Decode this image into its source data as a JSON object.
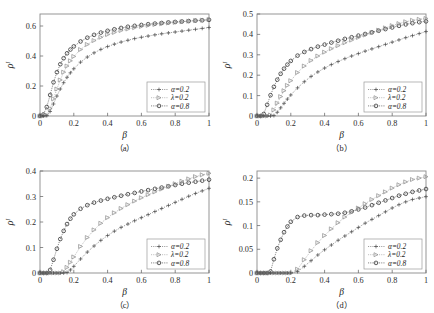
{
  "figure": {
    "panel_count": 4,
    "background": "#ffffff",
    "ink": "#1c1c1c"
  },
  "legend": {
    "entries": [
      {
        "label": "α=0.2",
        "marker": "plus",
        "color": "#4a4a4a"
      },
      {
        "label": "λ=0.2",
        "marker": "triangle-right",
        "color": "#8c8c8c"
      },
      {
        "label": "α=0.8",
        "marker": "circle",
        "color": "#1f1f1f"
      }
    ]
  },
  "axes": {
    "xlabel": "β",
    "ylabel_base": "ρ",
    "ylabel_sup": "I"
  },
  "chart_data": [
    {
      "type": "scatter",
      "panel": "a",
      "caption": "（a）",
      "title": "",
      "xlabel": "β",
      "ylabel": "ρᴵ",
      "xlim": [
        0,
        1
      ],
      "ylim": [
        0,
        0.68
      ],
      "xticks": [
        0,
        0.2,
        0.4,
        0.6,
        0.8,
        1
      ],
      "xticklabels": [
        "0",
        "0.2",
        "0.4",
        "0.6",
        "0.8",
        "1"
      ],
      "yticks": [
        0,
        0.2,
        0.4,
        0.6
      ],
      "yticklabels": [
        "0",
        "0.2",
        "0.4",
        "0.6"
      ],
      "grid": false,
      "legend_position": "lower-right",
      "x": [
        0.0,
        0.02,
        0.04,
        0.06,
        0.08,
        0.1,
        0.12,
        0.14,
        0.16,
        0.18,
        0.2,
        0.24,
        0.28,
        0.32,
        0.36,
        0.4,
        0.44,
        0.48,
        0.52,
        0.56,
        0.6,
        0.64,
        0.68,
        0.72,
        0.76,
        0.8,
        0.84,
        0.88,
        0.92,
        0.96,
        1.0
      ],
      "series": [
        {
          "name": "α=0.8",
          "marker": "circle",
          "color": "#1f1f1f",
          "values": [
            0.0,
            0.01,
            0.06,
            0.14,
            0.225,
            0.292,
            0.345,
            0.385,
            0.418,
            0.443,
            0.464,
            0.497,
            0.522,
            0.541,
            0.556,
            0.568,
            0.578,
            0.587,
            0.595,
            0.601,
            0.607,
            0.612,
            0.616,
            0.62,
            0.624,
            0.627,
            0.63,
            0.633,
            0.636,
            0.638,
            0.641
          ]
        },
        {
          "name": "λ=0.2",
          "marker": "triangle-right",
          "color": "#8c8c8c",
          "values": [
            0.0,
            0.0,
            0.005,
            0.05,
            0.115,
            0.18,
            0.24,
            0.292,
            0.333,
            0.368,
            0.397,
            0.443,
            0.477,
            0.503,
            0.525,
            0.543,
            0.557,
            0.57,
            0.58,
            0.589,
            0.597,
            0.604,
            0.61,
            0.615,
            0.62,
            0.624,
            0.628,
            0.632,
            0.636,
            0.639,
            0.643
          ]
        },
        {
          "name": "α=0.2",
          "marker": "plus",
          "color": "#4a4a4a",
          "values": [
            0.0,
            0.0,
            0.002,
            0.03,
            0.08,
            0.133,
            0.18,
            0.222,
            0.258,
            0.288,
            0.315,
            0.359,
            0.393,
            0.421,
            0.444,
            0.463,
            0.479,
            0.493,
            0.505,
            0.516,
            0.525,
            0.533,
            0.541,
            0.548,
            0.554,
            0.56,
            0.566,
            0.572,
            0.578,
            0.584,
            0.59
          ]
        }
      ]
    },
    {
      "type": "scatter",
      "panel": "b",
      "caption": "（b）",
      "title": "",
      "xlabel": "β",
      "ylabel": "ρᴵ",
      "xlim": [
        0,
        1
      ],
      "ylim": [
        0,
        0.5
      ],
      "xticks": [
        0,
        0.2,
        0.4,
        0.6,
        0.8,
        1
      ],
      "xticklabels": [
        "0",
        "0.2",
        "0.4",
        "0.6",
        "0.8",
        "1"
      ],
      "yticks": [
        0,
        0.1,
        0.2,
        0.3,
        0.4,
        0.5
      ],
      "yticklabels": [
        "0",
        "0.1",
        "0.2",
        "0.3",
        "0.4",
        "0.5"
      ],
      "grid": false,
      "legend_position": "lower-right",
      "x": [
        0.0,
        0.02,
        0.04,
        0.06,
        0.08,
        0.1,
        0.12,
        0.14,
        0.16,
        0.18,
        0.2,
        0.24,
        0.28,
        0.32,
        0.36,
        0.4,
        0.44,
        0.48,
        0.52,
        0.56,
        0.6,
        0.64,
        0.68,
        0.72,
        0.76,
        0.8,
        0.84,
        0.88,
        0.92,
        0.96,
        1.0
      ],
      "series": [
        {
          "name": "α=0.8",
          "marker": "circle",
          "color": "#1f1f1f",
          "values": [
            0.0,
            0.0,
            0.01,
            0.055,
            0.102,
            0.143,
            0.178,
            0.207,
            0.232,
            0.252,
            0.27,
            0.296,
            0.314,
            0.328,
            0.34,
            0.35,
            0.36,
            0.369,
            0.378,
            0.386,
            0.394,
            0.402,
            0.41,
            0.418,
            0.426,
            0.434,
            0.442,
            0.449,
            0.455,
            0.46,
            0.464
          ]
        },
        {
          "name": "λ=0.2",
          "marker": "triangle-right",
          "color": "#8c8c8c",
          "values": [
            0.0,
            0.0,
            0.0,
            0.0,
            0.005,
            0.03,
            0.063,
            0.095,
            0.124,
            0.15,
            0.173,
            0.213,
            0.245,
            0.272,
            0.294,
            0.313,
            0.33,
            0.345,
            0.359,
            0.372,
            0.385,
            0.397,
            0.409,
            0.421,
            0.432,
            0.443,
            0.453,
            0.462,
            0.469,
            0.474,
            0.478
          ]
        },
        {
          "name": "α=0.2",
          "marker": "plus",
          "color": "#4a4a4a",
          "values": [
            0.0,
            0.0,
            0.0,
            0.0,
            0.0,
            0.002,
            0.018,
            0.04,
            0.062,
            0.083,
            0.103,
            0.138,
            0.168,
            0.194,
            0.216,
            0.235,
            0.252,
            0.267,
            0.281,
            0.294,
            0.306,
            0.318,
            0.329,
            0.34,
            0.351,
            0.362,
            0.373,
            0.384,
            0.394,
            0.404,
            0.414
          ]
        }
      ]
    },
    {
      "type": "scatter",
      "panel": "c",
      "caption": "（c）",
      "title": "",
      "xlabel": "β",
      "ylabel": "ρᴵ",
      "xlim": [
        0,
        1
      ],
      "ylim": [
        0,
        0.4
      ],
      "xticks": [
        0,
        0.2,
        0.4,
        0.6,
        0.8,
        1
      ],
      "xticklabels": [
        "0",
        "0.2",
        "0.4",
        "0.6",
        "0.8",
        "1"
      ],
      "yticks": [
        0,
        0.1,
        0.2,
        0.3,
        0.4
      ],
      "yticklabels": [
        "0",
        "0.1",
        "0.2",
        "0.3",
        "0.4"
      ],
      "grid": false,
      "legend_position": "lower-right",
      "x": [
        0.0,
        0.02,
        0.04,
        0.06,
        0.08,
        0.1,
        0.12,
        0.14,
        0.16,
        0.18,
        0.2,
        0.24,
        0.28,
        0.32,
        0.36,
        0.4,
        0.44,
        0.48,
        0.52,
        0.56,
        0.6,
        0.64,
        0.68,
        0.72,
        0.76,
        0.8,
        0.84,
        0.88,
        0.92,
        0.96,
        1.0
      ],
      "series": [
        {
          "name": "α=0.8",
          "marker": "circle",
          "color": "#1f1f1f",
          "values": [
            0.0,
            0.0,
            0.0,
            0.012,
            0.052,
            0.095,
            0.133,
            0.165,
            0.192,
            0.213,
            0.23,
            0.252,
            0.266,
            0.276,
            0.284,
            0.291,
            0.297,
            0.303,
            0.309,
            0.314,
            0.32,
            0.325,
            0.33,
            0.335,
            0.34,
            0.345,
            0.35,
            0.354,
            0.358,
            0.362,
            0.366
          ]
        },
        {
          "name": "λ=0.2",
          "marker": "triangle-right",
          "color": "#8c8c8c",
          "values": [
            0.0,
            0.0,
            0.0,
            0.0,
            0.0,
            0.0,
            0.0,
            0.005,
            0.022,
            0.042,
            0.063,
            0.104,
            0.139,
            0.169,
            0.195,
            0.217,
            0.236,
            0.253,
            0.268,
            0.282,
            0.295,
            0.307,
            0.318,
            0.329,
            0.34,
            0.35,
            0.36,
            0.369,
            0.378,
            0.385,
            0.391
          ]
        },
        {
          "name": "α=0.2",
          "marker": "plus",
          "color": "#4a4a4a",
          "values": [
            0.0,
            0.0,
            0.0,
            0.0,
            0.0,
            0.0,
            0.0,
            0.0,
            0.002,
            0.012,
            0.026,
            0.055,
            0.082,
            0.106,
            0.128,
            0.147,
            0.164,
            0.179,
            0.192,
            0.205,
            0.217,
            0.229,
            0.241,
            0.253,
            0.265,
            0.277,
            0.289,
            0.301,
            0.312,
            0.322,
            0.332
          ]
        }
      ]
    },
    {
      "type": "scatter",
      "panel": "d",
      "caption": "（d）",
      "title": "",
      "xlabel": "β",
      "ylabel": "ρᴵ",
      "xlim": [
        0,
        1
      ],
      "ylim": [
        0,
        0.215
      ],
      "xticks": [
        0,
        0.2,
        0.4,
        0.6,
        0.8,
        1
      ],
      "xticklabels": [
        "0",
        "0.2",
        "0.4",
        "0.6",
        "0.8",
        "1"
      ],
      "yticks": [
        0,
        0.05,
        0.1,
        0.15,
        0.2
      ],
      "yticklabels": [
        "0",
        "0.05",
        "0.1",
        "0.15",
        "0.2"
      ],
      "grid": false,
      "legend_position": "lower-right",
      "x": [
        0.0,
        0.02,
        0.04,
        0.06,
        0.08,
        0.1,
        0.12,
        0.14,
        0.16,
        0.18,
        0.2,
        0.24,
        0.28,
        0.32,
        0.36,
        0.4,
        0.44,
        0.48,
        0.52,
        0.56,
        0.6,
        0.64,
        0.68,
        0.72,
        0.76,
        0.8,
        0.84,
        0.88,
        0.92,
        0.96,
        1.0
      ],
      "series": [
        {
          "name": "α=0.8",
          "marker": "circle",
          "color": "#1f1f1f",
          "values": [
            0.0,
            0.0,
            0.0,
            0.0,
            0.003,
            0.029,
            0.052,
            0.07,
            0.086,
            0.098,
            0.108,
            0.118,
            0.121,
            0.122,
            0.122,
            0.123,
            0.124,
            0.125,
            0.127,
            0.13,
            0.134,
            0.138,
            0.143,
            0.148,
            0.153,
            0.158,
            0.163,
            0.167,
            0.171,
            0.174,
            0.177
          ]
        },
        {
          "name": "λ=0.2",
          "marker": "triangle-right",
          "color": "#8c8c8c",
          "values": [
            0.0,
            0.0,
            0.0,
            0.0,
            0.0,
            0.0,
            0.0,
            0.0,
            0.0,
            0.0,
            0.0,
            0.008,
            0.028,
            0.047,
            0.064,
            0.079,
            0.093,
            0.106,
            0.118,
            0.128,
            0.137,
            0.146,
            0.155,
            0.163,
            0.171,
            0.179,
            0.186,
            0.192,
            0.197,
            0.2,
            0.203
          ]
        },
        {
          "name": "α=0.2",
          "marker": "plus",
          "color": "#4a4a4a",
          "values": [
            0.0,
            0.0,
            0.0,
            0.0,
            0.0,
            0.0,
            0.0,
            0.0,
            0.0,
            0.0,
            0.0,
            0.003,
            0.014,
            0.026,
            0.038,
            0.049,
            0.059,
            0.069,
            0.078,
            0.087,
            0.096,
            0.105,
            0.113,
            0.121,
            0.129,
            0.137,
            0.144,
            0.15,
            0.155,
            0.158,
            0.161
          ]
        }
      ]
    }
  ]
}
